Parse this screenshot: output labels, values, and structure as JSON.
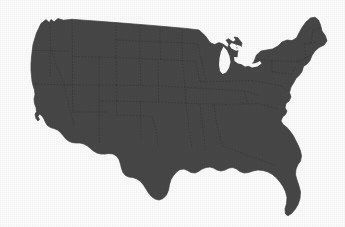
{
  "figure": {
    "kind": "map-image",
    "title": "Map of the contiguous United States",
    "alt_text": "Solid dark gray silhouette map of the contiguous United States with dashed state boundaries",
    "width_px": 345,
    "height_px": 227
  },
  "map": {
    "region_name": "Contiguous United States",
    "projection_hint": "albers-usa",
    "land_fill_color": "#474747",
    "background_color": "#fefefe",
    "state_border_color": "#333333",
    "state_border_style": "dashed",
    "state_border_width": 0.6,
    "coast_outline_color": "#3f3f3f",
    "bounds_px": {
      "left": 30,
      "top": 17,
      "right": 327,
      "bottom": 216
    },
    "features": [
      {
        "name": "pacific-northwest-coast",
        "label": "Pacific Northwest coastline"
      },
      {
        "name": "california-coast",
        "label": "California coastline"
      },
      {
        "name": "us-mexico-border",
        "label": "Southern border"
      },
      {
        "name": "gulf-coast",
        "label": "Gulf of Mexico coastline"
      },
      {
        "name": "florida-peninsula",
        "label": "Florida peninsula"
      },
      {
        "name": "atlantic-coast",
        "label": "Atlantic coastline"
      },
      {
        "name": "chesapeake-bay",
        "label": "Chesapeake Bay"
      },
      {
        "name": "new-england",
        "label": "New England"
      },
      {
        "name": "maine",
        "label": "Maine"
      },
      {
        "name": "great-lakes",
        "label": "Great Lakes"
      },
      {
        "name": "lake-michigan",
        "label": "Lake Michigan"
      },
      {
        "name": "michigan-upper-peninsula",
        "label": "Upper Peninsula"
      },
      {
        "name": "canadian-border",
        "label": "Northern border"
      }
    ]
  }
}
